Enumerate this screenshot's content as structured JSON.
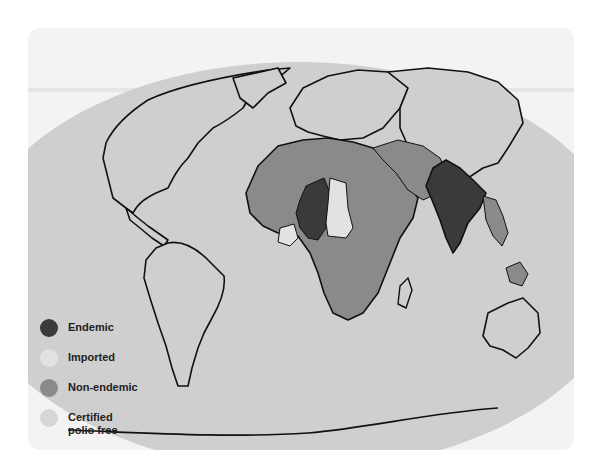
{
  "map": {
    "title": "",
    "projection": "elliptical world map",
    "colors": {
      "background": "#ffffff",
      "card": "#f3f3f3",
      "ocean": "#cfcfcf",
      "coastline": "#111111",
      "endemic": "#3a3a3a",
      "imported": "#e2e2e2",
      "non_endemic": "#8a8a8a",
      "certified_polio_free": "#cfcfcf"
    },
    "regions": {
      "endemic": [
        "Nigeria",
        "Niger",
        "India",
        "Pakistan",
        "Afghanistan"
      ],
      "imported": [
        "Chad",
        "Central African Republic",
        "Benin",
        "Togo",
        "Burkina Faso",
        "Cameroon"
      ],
      "non_endemic": [
        "North Africa",
        "West Africa",
        "East Africa",
        "Central Africa",
        "Southern Africa",
        "Arabian Peninsula",
        "Iran",
        "Nepal",
        "Bangladesh",
        "Myanmar",
        "Thailand",
        "Indonesia"
      ],
      "certified_polio_free": [
        "Americas",
        "Europe",
        "China",
        "Russia",
        "Australia",
        "Antarctica"
      ]
    }
  },
  "legend": {
    "items": [
      {
        "key": "endemic",
        "label": "Endemic",
        "color": "#3a3a3a"
      },
      {
        "key": "imported",
        "label": "Imported",
        "color": "#e2e2e2"
      },
      {
        "key": "non_endemic",
        "label": "Non-endemic",
        "color": "#8a8a8a"
      },
      {
        "key": "certified_polio_free",
        "label_line1": "Certified",
        "label_line2": "polio free",
        "color": "#cfcfcf"
      }
    ]
  }
}
